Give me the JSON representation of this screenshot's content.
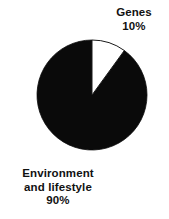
{
  "figure": {
    "background_color": "#ffffff",
    "width": 169,
    "height": 219
  },
  "chart_data": {
    "type": "pie",
    "title": "",
    "subtitle": "",
    "xlabel": "",
    "ylabel": "",
    "grid": false,
    "legend_position": "none",
    "start_angle_deg": 90,
    "direction": "clockwise",
    "center": {
      "x": 92,
      "y": 95
    },
    "radius": 55,
    "categories": [
      "Genes",
      "Environment and lifestyle"
    ],
    "values": [
      10,
      90
    ],
    "value_unit": "percent",
    "slices": [
      {
        "label": "Genes",
        "label_line_1": "Genes",
        "value": 10,
        "value_label": "10%",
        "color": "#ffffff",
        "edge_color": "#1a1a1a",
        "start_deg": 0,
        "sweep_deg": 36
      },
      {
        "label": "Environment and lifestyle",
        "label_line_1": "Environment",
        "label_line_2": "and lifestyle",
        "value": 90,
        "value_label": "90%",
        "color": "#0a0a0a",
        "edge_color": "#0a0a0a",
        "start_deg": 36,
        "sweep_deg": 324
      }
    ],
    "annotations": [
      {
        "text": "Genes",
        "position": "top-right"
      },
      {
        "text": "10%",
        "position": "top-right"
      },
      {
        "text": "Environment",
        "position": "bottom-left"
      },
      {
        "text": "and lifestyle",
        "position": "bottom-left"
      },
      {
        "text": "90%",
        "position": "bottom-left"
      }
    ]
  },
  "labels": {
    "genes": {
      "name": "Genes",
      "percent": "10%"
    },
    "environment": {
      "line1": "Environment",
      "line2": "and lifestyle",
      "percent": "90%"
    }
  },
  "colors": {
    "slice_dark": "#0a0a0a",
    "slice_light": "#ffffff",
    "outline": "#1a1a1a",
    "text": "#111111",
    "background": "#ffffff"
  }
}
